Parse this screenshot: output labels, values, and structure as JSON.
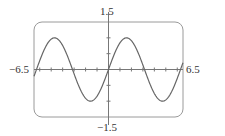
{
  "chart_data": {
    "type": "line",
    "title": "",
    "function": "y = sin(x)",
    "xlabel": "",
    "ylabel": "",
    "xlim": [
      -6.5,
      6.5
    ],
    "ylim": [
      -1.5,
      1.5
    ],
    "x_tick_step": 1,
    "y_tick_step": 0.5,
    "grid": false,
    "tick_labels": {
      "x_min": "−6.5",
      "x_max": "6.5",
      "y_min": "−1.5",
      "y_max": "1.5"
    },
    "series": [
      {
        "name": "sin(x)",
        "x": [
          -6.5,
          -6,
          -5.5,
          -5,
          -4.5,
          -4,
          -3.5,
          -3,
          -2.5,
          -2,
          -1.5,
          -1,
          -0.5,
          0,
          0.5,
          1,
          1.5,
          2,
          2.5,
          3,
          3.5,
          4,
          4.5,
          5,
          5.5,
          6,
          6.5
        ],
        "values": [
          -0.215,
          0.279,
          0.706,
          0.959,
          0.978,
          0.757,
          0.351,
          -0.141,
          -0.598,
          -0.909,
          -0.997,
          -0.841,
          -0.479,
          0,
          0.479,
          0.841,
          0.997,
          0.909,
          0.598,
          0.141,
          -0.351,
          -0.757,
          -0.978,
          -0.959,
          -0.706,
          -0.279,
          0.215
        ]
      }
    ]
  },
  "colors": {
    "frame": "#9a9a9a",
    "axes": "#777777",
    "curve": "#666666",
    "text": "#333333"
  }
}
